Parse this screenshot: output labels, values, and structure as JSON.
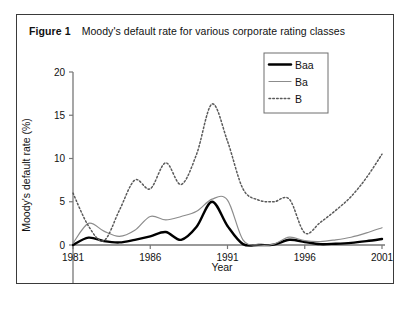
{
  "figure": {
    "label": "Figure 1",
    "caption": "Moody's default rate for various corporate rating classes"
  },
  "chart_data": {
    "type": "line",
    "title": "Moody's default rate for various corporate rating classes",
    "xlabel": "Year",
    "ylabel": "Moody's default rate (%)",
    "xlim": [
      1981,
      2001
    ],
    "ylim": [
      -5,
      20
    ],
    "xticks": [
      1981,
      1986,
      1991,
      1996,
      2001
    ],
    "yticks": [
      -5,
      0,
      5,
      10,
      15,
      20
    ],
    "grid": false,
    "legend_position": "top-right",
    "x": [
      1981,
      1982,
      1983,
      1984,
      1985,
      1986,
      1987,
      1988,
      1989,
      1990,
      1991,
      1992,
      1993,
      1994,
      1995,
      1996,
      1997,
      1998,
      1999,
      2000,
      2001
    ],
    "series": [
      {
        "name": "Baa",
        "color": "#000000",
        "style": "solid",
        "width": 2.4,
        "values": [
          0.0,
          0.85,
          0.45,
          0.3,
          0.6,
          1.0,
          1.5,
          0.6,
          2.1,
          5.0,
          2.2,
          0.1,
          0.0,
          0.05,
          0.6,
          0.35,
          0.1,
          0.15,
          0.25,
          0.45,
          0.7
        ]
      },
      {
        "name": "Ba",
        "color": "#8c8c8c",
        "style": "solid",
        "width": 1.2,
        "values": [
          0.2,
          2.5,
          1.6,
          1.0,
          1.7,
          3.3,
          2.9,
          3.3,
          3.9,
          5.3,
          5.2,
          0.6,
          0.0,
          0.1,
          0.9,
          0.5,
          0.4,
          0.6,
          0.9,
          1.4,
          2.0
        ]
      },
      {
        "name": "B",
        "color": "#5a5a5a",
        "style": "dotted",
        "width": 1.5,
        "values": [
          6.0,
          2.2,
          0.5,
          4.0,
          7.5,
          6.5,
          9.5,
          7.0,
          10.5,
          16.3,
          12.0,
          6.5,
          5.2,
          5.0,
          5.3,
          1.4,
          2.6,
          4.0,
          5.6,
          7.8,
          10.5
        ]
      }
    ]
  }
}
